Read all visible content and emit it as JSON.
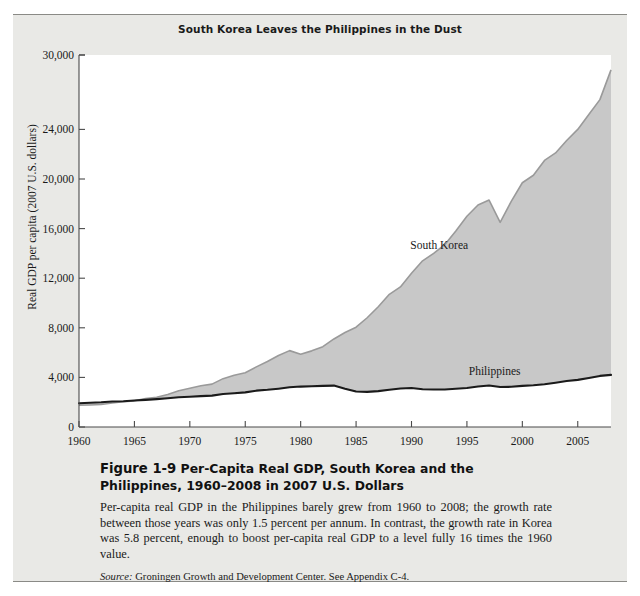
{
  "figure": {
    "chart_title": "South Korea Leaves the Philippines in the Dust",
    "caption_figure_number": "Figure 1-9",
    "caption_title": "Per-Capita Real GDP, South Korea and the Philippines, 1960–2008 in 2007 U.S. Dollars",
    "caption_body": "Per-capita real GDP in the Philippines barely grew from 1960 to 2008; the growth rate between those years was only 1.5 percent per annum. In contrast, the growth rate in Korea was 5.8 percent, enough to boost per-capita real GDP to a level fully 16 times the 1960 value.",
    "source_word": "Source:",
    "source_text": " Groningen Growth and Development Center. See Appendix C-4."
  },
  "colors": {
    "area_fill": "#c8c8c8",
    "area_stroke": "#9a9a9a",
    "philippines_line": "#1a1a1a",
    "panel_bg": "#e9e9e6",
    "plot_bg": "#ffffff",
    "axis": "#4a4a4a",
    "text": "#1a1a1a"
  },
  "chart_data": {
    "type": "area",
    "title": "South Korea Leaves the Philippines in the Dust",
    "xlabel": "",
    "ylabel": "Real GDP per capita (2007 U.S. dollars)",
    "xlim": [
      1960,
      2008
    ],
    "ylim": [
      0,
      30000
    ],
    "grid": false,
    "legend": "inline-series-labels",
    "y_ticks": [
      0,
      4000,
      8000,
      12000,
      16000,
      20000,
      24000,
      30000
    ],
    "y_tick_labels": [
      "0",
      "4,000",
      "8,000",
      "12,000",
      "16,000",
      "20,000",
      "24,000",
      "30,000"
    ],
    "x_ticks": [
      1960,
      1965,
      1970,
      1975,
      1980,
      1985,
      1990,
      1995,
      2000,
      2005
    ],
    "x_tick_labels": [
      "1960",
      "1965",
      "1970",
      "1975",
      "1980",
      "1985",
      "1990",
      "1995",
      "2000",
      "2005"
    ],
    "x": [
      1960,
      1961,
      1962,
      1963,
      1964,
      1965,
      1966,
      1967,
      1968,
      1969,
      1970,
      1971,
      1972,
      1973,
      1974,
      1975,
      1976,
      1977,
      1978,
      1979,
      1980,
      1981,
      1982,
      1983,
      1984,
      1985,
      1986,
      1987,
      1988,
      1989,
      1990,
      1991,
      1992,
      1993,
      1994,
      1995,
      1996,
      1997,
      1998,
      1999,
      2000,
      2001,
      2002,
      2003,
      2004,
      2005,
      2006,
      2007,
      2008
    ],
    "series": [
      {
        "name": "South Korea",
        "label_position": {
          "x": 1992.5,
          "y": 14600
        },
        "values": [
          1750,
          1780,
          1820,
          1930,
          2030,
          2110,
          2290,
          2400,
          2620,
          2930,
          3120,
          3330,
          3460,
          3900,
          4180,
          4380,
          4850,
          5280,
          5770,
          6160,
          5870,
          6140,
          6480,
          7100,
          7620,
          8050,
          8810,
          9700,
          10700,
          11300,
          12400,
          13400,
          14000,
          14700,
          15800,
          17000,
          17900,
          18300,
          16500,
          18200,
          19700,
          20300,
          21500,
          22100,
          23100,
          24000,
          25200,
          26400,
          28800
        ]
      },
      {
        "name": "Philippines",
        "label_position": {
          "x": 1997.5,
          "y": 4450
        },
        "values": [
          1920,
          1960,
          1990,
          2060,
          2080,
          2140,
          2190,
          2250,
          2320,
          2400,
          2440,
          2490,
          2530,
          2660,
          2720,
          2790,
          2930,
          3000,
          3090,
          3200,
          3260,
          3290,
          3320,
          3340,
          3080,
          2860,
          2830,
          2890,
          3000,
          3110,
          3140,
          3050,
          3020,
          3030,
          3090,
          3150,
          3260,
          3350,
          3220,
          3240,
          3320,
          3370,
          3450,
          3570,
          3710,
          3800,
          3950,
          4120,
          4200
        ]
      }
    ]
  }
}
